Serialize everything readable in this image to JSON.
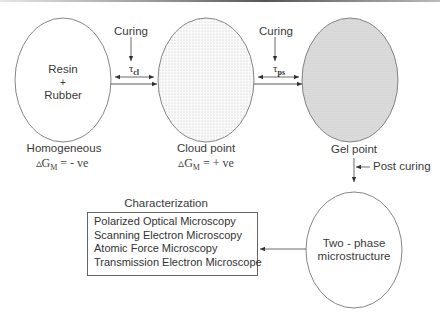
{
  "nodes": {
    "homogeneous": {
      "line1": "Resin",
      "line2": "+",
      "line3": "Rubber",
      "caption": "Homogeneous",
      "delta_sym": "▵G",
      "delta_sub": "M",
      "delta_val": " = - ve"
    },
    "cloud_point": {
      "caption": "Cloud point",
      "delta_sym": "▵G",
      "delta_sub": "M",
      "delta_val": " = + ve"
    },
    "gel_point": {
      "caption": "Gel point"
    },
    "two_phase": {
      "line1": "Two - phase",
      "line2": "microstructure"
    }
  },
  "transitions": {
    "first": {
      "label": "Curing",
      "tau": "τ",
      "tau_sub": "cl"
    },
    "second": {
      "label": "Curing",
      "tau": "τ",
      "tau_sub": "ps"
    },
    "third": {
      "label": "Post curing"
    }
  },
  "characterization": {
    "title": "Characterization",
    "items": [
      "Polarized Optical Microscopy",
      "Scanning Electron Microscopy",
      "Atomic Force Microscopy",
      "Transmission Electron Microscope"
    ]
  }
}
